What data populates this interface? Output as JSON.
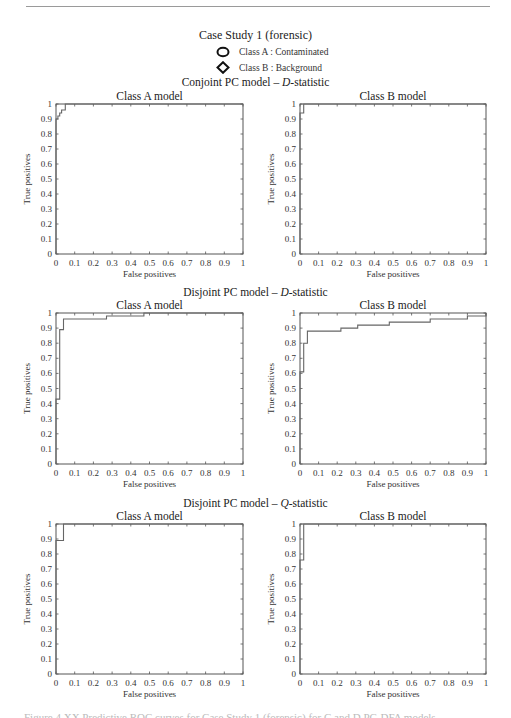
{
  "header": {
    "title": "Case Study 1 (forensic)",
    "legend": [
      {
        "marker": "circle-icon",
        "label": "Class A : Contaminated"
      },
      {
        "marker": "diamond-icon",
        "label": "Class B : Background"
      }
    ]
  },
  "sections": [
    {
      "title_prefix": "Conjoint PC model – ",
      "title_italic": "D",
      "title_suffix": "-statistic"
    },
    {
      "title_prefix": "Disjoint PC model – ",
      "title_italic": "D",
      "title_suffix": "-statistic"
    },
    {
      "title_prefix": "Disjoint PC model – ",
      "title_italic": "Q",
      "title_suffix": "-statistic"
    }
  ],
  "caption": "Figure 4.XX  Predictive ROC curves for Case Study 1 (forensic) for C and D PC-DFA models",
  "chart_data": [
    {
      "type": "line",
      "step": true,
      "title": "Class A model",
      "section": "Conjoint PC model – D-statistic",
      "xlabel": "False positives",
      "ylabel": "True positives",
      "xlim": [
        0,
        1
      ],
      "ylim": [
        0,
        1
      ],
      "xticks": [
        "0",
        "0.1",
        "0.2",
        "0.3",
        "0.4",
        "0.5",
        "0.6",
        "0.7",
        "0.8",
        "0.9",
        "1"
      ],
      "yticks": [
        "0",
        "0.1",
        "0.2",
        "0.3",
        "0.4",
        "0.5",
        "0.6",
        "0.7",
        "0.8",
        "0.9",
        "1"
      ],
      "grid": false,
      "x": [
        0,
        0,
        0.01,
        0.01,
        0.02,
        0.02,
        0.03,
        0.03,
        0.05,
        0.05,
        1
      ],
      "y": [
        0,
        0.9,
        0.9,
        0.92,
        0.92,
        0.94,
        0.94,
        0.96,
        0.96,
        1,
        1
      ]
    },
    {
      "type": "line",
      "step": true,
      "title": "Class B model",
      "section": "Conjoint PC model – D-statistic",
      "xlabel": "False positives",
      "ylabel": "True positives",
      "xlim": [
        0,
        1
      ],
      "ylim": [
        0,
        1
      ],
      "xticks": [
        "0",
        "0.1",
        "0.2",
        "0.3",
        "0.4",
        "0.5",
        "0.6",
        "0.7",
        "0.8",
        "0.9",
        "1"
      ],
      "yticks": [
        "0",
        "0.1",
        "0.2",
        "0.3",
        "0.4",
        "0.5",
        "0.6",
        "0.7",
        "0.8",
        "0.9",
        "1"
      ],
      "grid": false,
      "x": [
        0,
        0,
        0.02,
        0.02,
        1
      ],
      "y": [
        0,
        0.94,
        0.94,
        1,
        1
      ]
    },
    {
      "type": "line",
      "step": true,
      "title": "Class A model",
      "section": "Disjoint PC model – D-statistic",
      "xlabel": "False positives",
      "ylabel": "True positives",
      "xlim": [
        0,
        1
      ],
      "ylim": [
        0,
        1
      ],
      "xticks": [
        "0",
        "0.1",
        "0.2",
        "0.3",
        "0.4",
        "0.5",
        "0.6",
        "0.7",
        "0.8",
        "0.9",
        "1"
      ],
      "yticks": [
        "0",
        "0.1",
        "0.2",
        "0.3",
        "0.4",
        "0.5",
        "0.6",
        "0.7",
        "0.8",
        "0.9",
        "1"
      ],
      "grid": false,
      "x": [
        0,
        0,
        0.02,
        0.02,
        0.04,
        0.04,
        0.27,
        0.27,
        0.47,
        0.47,
        1
      ],
      "y": [
        0,
        0.43,
        0.43,
        0.89,
        0.89,
        0.96,
        0.96,
        0.98,
        0.98,
        1,
        1
      ]
    },
    {
      "type": "line",
      "step": true,
      "title": "Class B model",
      "section": "Disjoint PC model – D-statistic",
      "xlabel": "False positives",
      "ylabel": "True positives",
      "xlim": [
        0,
        1
      ],
      "ylim": [
        0,
        1
      ],
      "xticks": [
        "0",
        "0.1",
        "0.2",
        "0.3",
        "0.4",
        "0.5",
        "0.6",
        "0.7",
        "0.8",
        "0.9",
        "1"
      ],
      "yticks": [
        "0",
        "0.1",
        "0.2",
        "0.3",
        "0.4",
        "0.5",
        "0.6",
        "0.7",
        "0.8",
        "0.9",
        "1"
      ],
      "grid": false,
      "x": [
        0,
        0,
        0.02,
        0.02,
        0.04,
        0.04,
        0.22,
        0.22,
        0.31,
        0.31,
        0.48,
        0.48,
        0.7,
        0.7,
        0.9,
        0.9,
        1,
        1
      ],
      "y": [
        0,
        0.61,
        0.61,
        0.8,
        0.8,
        0.88,
        0.88,
        0.9,
        0.9,
        0.92,
        0.92,
        0.94,
        0.94,
        0.96,
        0.96,
        0.98,
        0.98,
        1
      ]
    },
    {
      "type": "line",
      "step": true,
      "title": "Class A model",
      "section": "Disjoint PC model – Q-statistic",
      "xlabel": "False positives",
      "ylabel": "True positives",
      "xlim": [
        0,
        1
      ],
      "ylim": [
        0,
        1
      ],
      "xticks": [
        "0",
        "0.1",
        "0.2",
        "0.3",
        "0.4",
        "0.5",
        "0.6",
        "0.7",
        "0.8",
        "0.9",
        "1"
      ],
      "yticks": [
        "0",
        "0.1",
        "0.2",
        "0.3",
        "0.4",
        "0.5",
        "0.6",
        "0.7",
        "0.8",
        "0.9",
        "1"
      ],
      "grid": false,
      "x": [
        0,
        0,
        0.04,
        0.04,
        1
      ],
      "y": [
        0,
        0.89,
        0.89,
        1,
        1
      ]
    },
    {
      "type": "line",
      "step": true,
      "title": "Class B model",
      "section": "Disjoint PC model – Q-statistic",
      "xlabel": "False positives",
      "ylabel": "True positives",
      "xlim": [
        0,
        1
      ],
      "ylim": [
        0,
        1
      ],
      "xticks": [
        "0",
        "0.1",
        "0.2",
        "0.3",
        "0.4",
        "0.5",
        "0.6",
        "0.7",
        "0.8",
        "0.9",
        "1"
      ],
      "yticks": [
        "0",
        "0.1",
        "0.2",
        "0.3",
        "0.4",
        "0.5",
        "0.6",
        "0.7",
        "0.8",
        "0.9",
        "1"
      ],
      "grid": false,
      "x": [
        0,
        0,
        0.02,
        0.02,
        1
      ],
      "y": [
        0,
        0.76,
        0.76,
        1,
        1
      ]
    }
  ]
}
